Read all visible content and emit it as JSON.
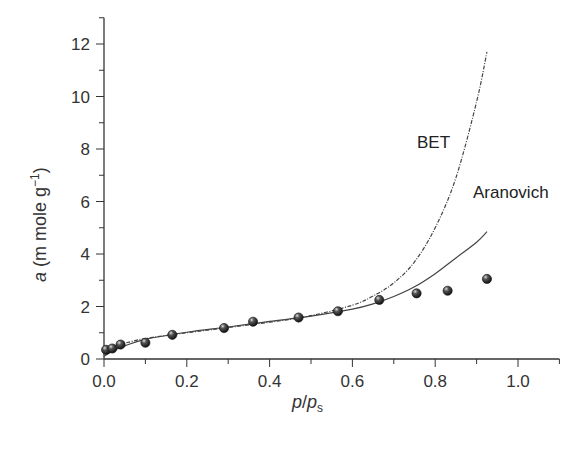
{
  "chart_data": {
    "type": "line",
    "title": "",
    "xlabel": "p/p_s",
    "ylabel": "a (m mole g^-1)",
    "xlim": [
      0.0,
      1.1
    ],
    "ylim": [
      0,
      13
    ],
    "x_ticks": [
      "0.0",
      "0.2",
      "0.4",
      "0.6",
      "0.8",
      "1.0"
    ],
    "y_ticks": [
      "0",
      "2",
      "4",
      "6",
      "8",
      "10",
      "12"
    ],
    "grid": false,
    "legend": "inline labels",
    "series": [
      {
        "name": "Experimental",
        "type": "scatter",
        "x": [
          0.005,
          0.02,
          0.04,
          0.1,
          0.165,
          0.29,
          0.36,
          0.47,
          0.565,
          0.665,
          0.755,
          0.83,
          0.925
        ],
        "y": [
          0.35,
          0.4,
          0.55,
          0.62,
          0.92,
          1.18,
          1.42,
          1.58,
          1.82,
          2.25,
          2.5,
          2.6,
          3.05
        ]
      },
      {
        "name": "BET",
        "type": "line",
        "style": "dashed",
        "x": [
          0.0,
          0.02,
          0.05,
          0.1,
          0.2,
          0.3,
          0.4,
          0.5,
          0.6,
          0.65,
          0.7,
          0.75,
          0.8,
          0.85,
          0.9,
          0.925
        ],
        "y": [
          0.3,
          0.45,
          0.6,
          0.78,
          1.0,
          1.2,
          1.4,
          1.65,
          2.05,
          2.4,
          2.9,
          3.7,
          5.0,
          6.9,
          9.8,
          11.7
        ]
      },
      {
        "name": "Aranovich",
        "type": "line",
        "style": "solid",
        "x": [
          0.0,
          0.02,
          0.05,
          0.1,
          0.2,
          0.3,
          0.4,
          0.5,
          0.6,
          0.65,
          0.7,
          0.75,
          0.8,
          0.85,
          0.9,
          0.925
        ],
        "y": [
          0.1,
          0.3,
          0.5,
          0.75,
          1.02,
          1.22,
          1.43,
          1.63,
          1.9,
          2.1,
          2.38,
          2.75,
          3.25,
          3.85,
          4.45,
          4.85
        ]
      }
    ],
    "annotations": [
      {
        "text": "BET",
        "x": 0.76,
        "y": 8.2
      },
      {
        "text": "Aranovich",
        "x": 0.89,
        "y": 6.3
      }
    ]
  },
  "labels": {
    "bet": "BET",
    "aranovich": "Aranovich",
    "x_axis_p": "p",
    "x_axis_slash": "/",
    "x_axis_ps": "p",
    "x_axis_sub": "s",
    "y_axis_a": "a",
    "y_axis_units": " (m mole g",
    "y_axis_sup": "−1",
    "y_axis_close": ")"
  }
}
